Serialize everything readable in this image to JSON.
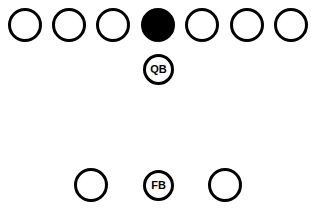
{
  "diagram": {
    "type": "football-formation",
    "colors": {
      "stroke": "#000000",
      "fill_center": "#000000",
      "background": "#ffffff"
    },
    "offensive_line": [
      {
        "role": "lineman",
        "filled": false,
        "cx": 25,
        "cy": 25
      },
      {
        "role": "lineman",
        "filled": false,
        "cx": 69,
        "cy": 25
      },
      {
        "role": "lineman",
        "filled": false,
        "cx": 113,
        "cy": 25
      },
      {
        "role": "center",
        "filled": true,
        "cx": 158,
        "cy": 25
      },
      {
        "role": "lineman",
        "filled": false,
        "cx": 202,
        "cy": 25
      },
      {
        "role": "lineman",
        "filled": false,
        "cx": 247,
        "cy": 25
      },
      {
        "role": "lineman",
        "filled": false,
        "cx": 291,
        "cy": 25
      }
    ],
    "qb": {
      "label": "QB",
      "cx": 158,
      "cy": 69
    },
    "backfield": [
      {
        "role": "halfback",
        "label": "",
        "cx": 91,
        "cy": 185
      },
      {
        "role": "fullback",
        "label": "FB",
        "cx": 158,
        "cy": 185
      },
      {
        "role": "halfback",
        "label": "",
        "cx": 225,
        "cy": 185
      }
    ]
  }
}
